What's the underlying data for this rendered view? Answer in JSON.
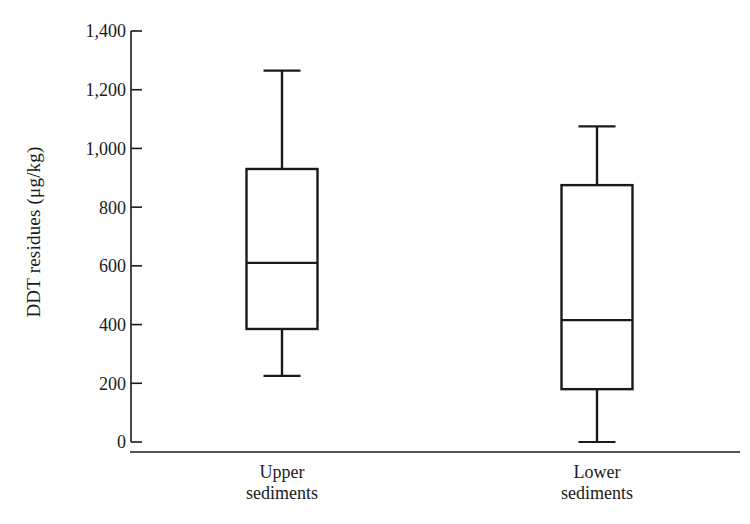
{
  "chart_data": {
    "type": "box",
    "title": "",
    "xlabel": "",
    "ylabel": "DDT residues (μg/kg)",
    "ylim": [
      0,
      1400
    ],
    "ytick_step": 200,
    "ytick_labels": [
      "1,400",
      "1,200",
      "1,000",
      "800",
      "600",
      "400",
      "200",
      "0"
    ],
    "ytick_values": [
      1400,
      1200,
      1000,
      800,
      600,
      400,
      200,
      0
    ],
    "grid": false,
    "legend": null,
    "categories": [
      "Upper\nsediments",
      "Lower\nsediments"
    ],
    "boxes": [
      {
        "category": "Upper sediments",
        "whisker_low": 225,
        "q1": 385,
        "median": 610,
        "q3": 930,
        "whisker_high": 1265
      },
      {
        "category": "Lower sediments",
        "whisker_low": 0,
        "q1": 180,
        "median": 415,
        "q3": 875,
        "whisker_high": 1075
      }
    ],
    "line_color": "#1a1a1a",
    "box_fill": "#ffffff",
    "background": "#ffffff"
  },
  "axis": {
    "y_label": "DDT residues (μg/kg)",
    "tick_0": "1,400",
    "tick_1": "1,200",
    "tick_2": "1,000",
    "tick_3": "800",
    "tick_4": "600",
    "tick_5": "400",
    "tick_6": "200",
    "tick_7": "0"
  },
  "categories": {
    "cat_0": "Upper\nsediments",
    "cat_1": "Lower\nsediments"
  }
}
